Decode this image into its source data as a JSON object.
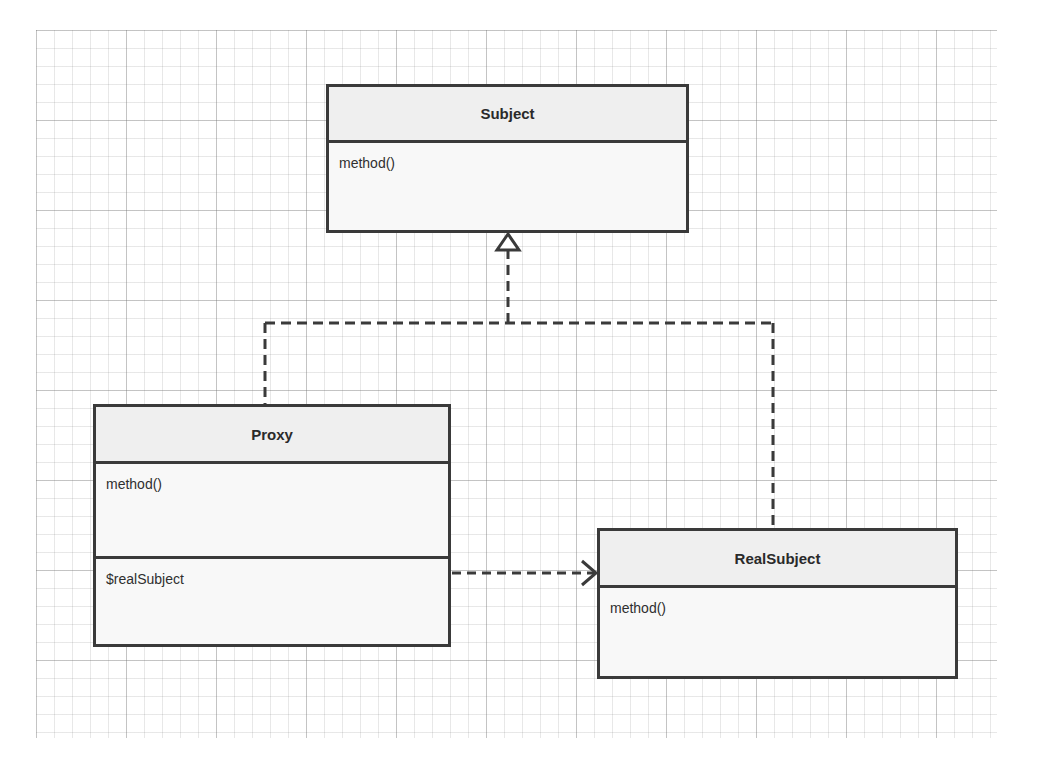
{
  "diagram": {
    "type": "UML class diagram",
    "pattern": "Proxy",
    "line_color": "#3a3a3a",
    "header_fill": "#efefef",
    "classes": {
      "subject": {
        "name": "Subject",
        "methods": [
          "method()"
        ],
        "attributes": []
      },
      "proxy": {
        "name": "Proxy",
        "methods": [
          "method()"
        ],
        "attributes": [
          "$realSubject"
        ]
      },
      "real_subject": {
        "name": "RealSubject",
        "methods": [
          "method()"
        ],
        "attributes": []
      }
    },
    "relationships": [
      {
        "from": "Proxy",
        "to": "Subject",
        "type": "realization",
        "style": "dashed line, hollow triangle"
      },
      {
        "from": "RealSubject",
        "to": "Subject",
        "type": "realization",
        "style": "dashed line, hollow triangle"
      },
      {
        "from": "Proxy",
        "to": "RealSubject",
        "type": "dependency",
        "style": "dashed line, open arrow"
      }
    ]
  }
}
